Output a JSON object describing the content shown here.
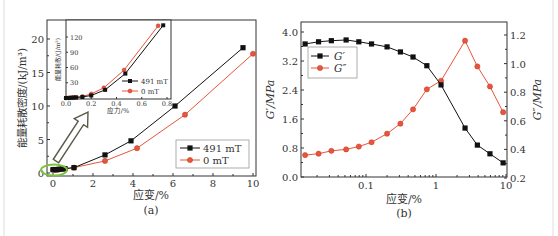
{
  "chart_data": [
    {
      "id": "a",
      "type": "line",
      "caption": "(a)",
      "xlabel": "应变/%",
      "ylabel": "能量耗散密度/(kJ/m³)",
      "xlim": [
        -0.3,
        10.2
      ],
      "ylim": [
        0,
        23
      ],
      "xticks": [
        0,
        2,
        4,
        6,
        8,
        10
      ],
      "yticks": [
        0,
        5,
        10,
        15,
        20
      ],
      "legend_position": "lower right",
      "series": [
        {
          "name": "491 mT",
          "color": "#111111",
          "marker": "square",
          "x": [
            0.0,
            0.1,
            0.2,
            0.3,
            0.45,
            0.6,
            1.05,
            2.6,
            3.9,
            6.1,
            9.5
          ],
          "y": [
            0.5,
            0.5,
            0.5,
            0.55,
            0.6,
            0.65,
            0.8,
            2.7,
            4.8,
            10.0,
            18.7
          ]
        },
        {
          "name": "0 mT",
          "color": "#e8553a",
          "marker": "circle",
          "x": [
            0.0,
            0.1,
            0.2,
            0.3,
            0.45,
            0.6,
            1.05,
            2.6,
            4.2,
            6.6,
            10.0
          ],
          "y": [
            0.5,
            0.5,
            0.5,
            0.55,
            0.6,
            0.65,
            0.8,
            1.8,
            3.7,
            8.7,
            17.8
          ]
        }
      ],
      "annotations": [
        {
          "type": "ellipse",
          "color": "#7cc43a",
          "note": "highlighted low-strain region"
        },
        {
          "type": "arrow",
          "color": "#5a5a48",
          "note": "points to inset"
        }
      ],
      "inset": {
        "type": "line",
        "xlabel": "应力/%",
        "ylabel": "能量耗散/(J/m³)",
        "xlim": [
          0,
          0.8
        ],
        "ylim": [
          0,
          150
        ],
        "xticks": [
          0.0,
          0.2,
          0.4,
          0.6,
          0.8
        ],
        "yticks": [
          30,
          60,
          90,
          120
        ],
        "legend_position": "lower right",
        "series": [
          {
            "name": "491 mT",
            "color": "#111111",
            "marker": "square",
            "x": [
              0.0,
              0.02,
              0.04,
              0.06,
              0.08,
              0.13,
              0.2,
              0.31,
              0.47,
              0.77
            ],
            "y": [
              0,
              0,
              0.5,
              0.8,
              1,
              2,
              5,
              16,
              48,
              143
            ]
          },
          {
            "name": "0 mT",
            "color": "#e8553a",
            "marker": "circle",
            "x": [
              0.0,
              0.02,
              0.04,
              0.06,
              0.08,
              0.13,
              0.2,
              0.3,
              0.46,
              0.73
            ],
            "y": [
              0,
              0.3,
              0.6,
              1,
              1.5,
              3,
              8,
              20,
              55,
              142
            ]
          }
        ]
      }
    },
    {
      "id": "b",
      "type": "line",
      "caption": "(b)",
      "xlabel": "应变/%",
      "ylabel": "G′/MPa",
      "ylabel_right": "G″/MPa",
      "xscale": "log",
      "xlim": [
        0.011,
        10
      ],
      "ylim": [
        0,
        4.2
      ],
      "ylim_right": [
        0.2,
        1.3
      ],
      "xticks": [
        0.1,
        1,
        10
      ],
      "xtick_labels": [
        "0.1",
        "1",
        "10"
      ],
      "yticks": [
        0.0,
        0.8,
        1.6,
        2.4,
        3.2,
        4.0
      ],
      "ytick_labels": [
        "0.0",
        "0.8",
        "1.6",
        "2.4",
        "3.2",
        "4.0"
      ],
      "yticks_right": [
        0.2,
        0.4,
        0.6,
        0.8,
        1.0,
        1.2
      ],
      "ytick_labels_right": [
        "0.2",
        "0.4",
        "0.6",
        "0.8",
        "1.0",
        "1.2"
      ],
      "legend_position": "upper left",
      "x": [
        0.0135,
        0.021,
        0.032,
        0.052,
        0.079,
        0.12,
        0.2,
        0.31,
        0.47,
        0.74,
        1.18,
        2.6,
        3.9,
        5.9,
        9.1
      ],
      "series": [
        {
          "name": "G′",
          "axis": "left",
          "color": "#111111",
          "marker": "square",
          "y": [
            3.67,
            3.73,
            3.76,
            3.78,
            3.73,
            3.67,
            3.59,
            3.45,
            3.31,
            3.07,
            2.54,
            1.35,
            0.88,
            0.64,
            0.39
          ]
        },
        {
          "name": "G″",
          "axis": "right",
          "color": "#e8553a",
          "marker": "circle",
          "y": [
            0.36,
            0.37,
            0.39,
            0.4,
            0.42,
            0.45,
            0.51,
            0.58,
            0.68,
            0.82,
            0.88,
            1.16,
            0.98,
            0.84,
            0.66
          ]
        }
      ]
    }
  ]
}
